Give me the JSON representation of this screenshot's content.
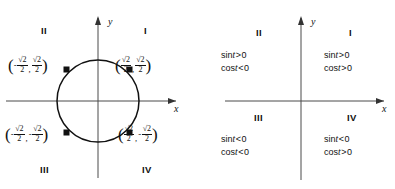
{
  "left_panel": {
    "name": "unit-circle-diagram",
    "axis_x_label": "x",
    "axis_y_label": "y",
    "quadrants": [
      {
        "id": "I",
        "label": "I"
      },
      {
        "id": "II",
        "label": "II"
      },
      {
        "id": "III",
        "label": "III"
      },
      {
        "id": "IV",
        "label": "IV"
      }
    ],
    "points": [
      {
        "id": "point-quadrant-2",
        "x_sign": "-",
        "x_num": "√2",
        "x_den": "2",
        "y_sign": "",
        "y_num": "√2",
        "y_den": "2",
        "text": "(-√2/2, √2/2)"
      },
      {
        "id": "point-quadrant-1",
        "x_sign": "",
        "x_num": "√2",
        "x_den": "2",
        "y_sign": "",
        "y_num": "√2",
        "y_den": "2",
        "text": "(√2/2, √2/2)"
      },
      {
        "id": "point-quadrant-3",
        "x_sign": "-",
        "x_num": "√2",
        "x_den": "2",
        "y_sign": "-",
        "y_num": "√2",
        "y_den": "2",
        "text": "(-√2/2, -√2/2)"
      },
      {
        "id": "point-quadrant-4",
        "x_sign": "",
        "x_num": "√2",
        "x_den": "2",
        "y_sign": "-",
        "y_num": "√2",
        "y_den": "2",
        "text": "(√2/2, -√2/2)"
      }
    ],
    "open_paren": "(",
    "close_paren": ")",
    "comma": ",",
    "minus": "−"
  },
  "right_panel": {
    "name": "trig-sign-chart",
    "axis_x_label": "x",
    "axis_y_label": "y",
    "quadrants": [
      {
        "id": "I",
        "label": "I",
        "sin_fn": "sin",
        "sin_var": "t",
        "sin_rel": ">",
        "sin_value": "0",
        "cos_fn": "cos",
        "cos_var": "t",
        "cos_rel": ">",
        "cos_value": "0"
      },
      {
        "id": "II",
        "label": "II",
        "sin_fn": "sin",
        "sin_var": "t",
        "sin_rel": ">",
        "sin_value": "0",
        "cos_fn": "cos",
        "cos_var": "t",
        "cos_rel": "<",
        "cos_value": "0"
      },
      {
        "id": "III",
        "label": "III",
        "sin_fn": "sin",
        "sin_var": "t",
        "sin_rel": "<",
        "sin_value": "0",
        "cos_fn": "cos",
        "cos_var": "t",
        "cos_rel": "<",
        "cos_value": "0"
      },
      {
        "id": "IV",
        "label": "IV",
        "sin_fn": "sin",
        "sin_var": "t",
        "sin_rel": "<",
        "sin_value": "0",
        "cos_fn": "cos",
        "cos_var": "t",
        "cos_rel": ">",
        "cos_value": "0"
      }
    ]
  },
  "colors": {
    "ink": "#111111",
    "axis": "#4a4a4a",
    "curve": "#111111",
    "background": "#ffffff"
  }
}
